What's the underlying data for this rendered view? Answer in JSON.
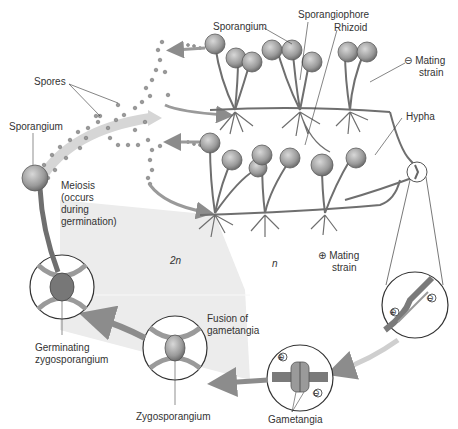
{
  "diagram": {
    "labels": {
      "spores": "Spores",
      "sporangium_left": "Sporangium",
      "sporangium_top": "Sporangium",
      "sporangiophore": "Sporangiophore",
      "rhizoid": "Rhizoid",
      "minus_mating_strain_line1": "Mating",
      "minus_mating_strain_line2": "strain",
      "hypha": "Hypha",
      "meiosis_line1": "Meiosis",
      "meiosis_line2": "(occurs",
      "meiosis_line3": "during",
      "meiosis_line4": "germination)",
      "diploid": "2n",
      "haploid": "n",
      "plus_mating_strain_line1": "Mating",
      "plus_mating_strain_line2": "strain",
      "fusion_line1": "Fusion of",
      "fusion_line2": "gametangia",
      "germinating_line1": "Germinating",
      "germinating_line2": "zygosporangium",
      "zygosporangium": "Zygosporangium",
      "gametangia": "Gametangia"
    },
    "symbols": {
      "minus": "⊖",
      "plus": "⊕"
    },
    "colors": {
      "structure": "#7a7a7a",
      "structure_dark": "#555555",
      "arrow": "#8c8c8c",
      "diploid_region": "#e6e6e6",
      "text": "#333333"
    }
  }
}
